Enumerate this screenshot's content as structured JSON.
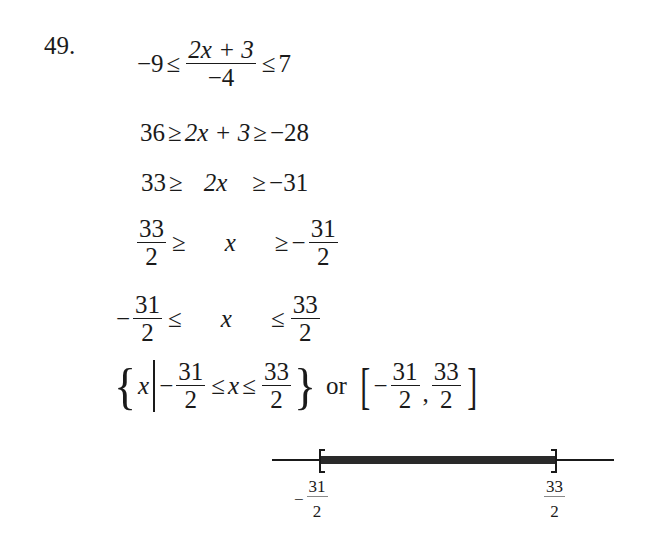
{
  "problem": {
    "number": "49.",
    "steps": [
      {
        "left": "−9",
        "op1": "≤",
        "frac_num": "2x + 3",
        "frac_den": "−4",
        "op2": "≤",
        "right": "7"
      },
      {
        "left": "36",
        "op1": "≥",
        "middle": "2x + 3",
        "op2": "≥",
        "right": "−28"
      },
      {
        "left": "33",
        "op1": "≥",
        "middle": "2x",
        "op2": "≥",
        "right": "−31"
      },
      {
        "left_num": "33",
        "left_den": "2",
        "op1": "≥",
        "middle": "x",
        "op2": "≥",
        "right_sign": "−",
        "right_num": "31",
        "right_den": "2"
      },
      {
        "left_sign": "−",
        "left_num": "31",
        "left_den": "2",
        "op1": "≤",
        "middle": "x",
        "op2": "≤",
        "right_num": "33",
        "right_den": "2"
      }
    ],
    "solution": {
      "set_open": "{",
      "set_var": "x",
      "lower_sign": "−",
      "lower_num": "31",
      "lower_den": "2",
      "op1": "≤",
      "var": "x",
      "op2": "≤",
      "upper_num": "33",
      "upper_den": "2",
      "set_close": "}",
      "connector": "or",
      "interval_open": "[",
      "interval_close": "]",
      "comma": ","
    },
    "number_line": {
      "left_label_sign": "−",
      "left_label_num": "31",
      "left_label_den": "2",
      "right_label_num": "33",
      "right_label_den": "2",
      "left_endpoint": "closed",
      "right_endpoint": "closed",
      "fill_color": "#2a2a2a"
    }
  }
}
